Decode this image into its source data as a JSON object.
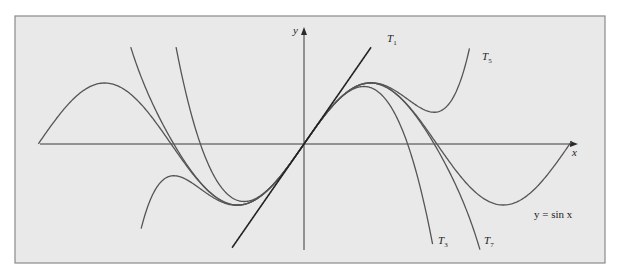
{
  "figure": {
    "title": "",
    "frame": {
      "x": 15,
      "y": 16,
      "width": 590,
      "height": 247,
      "background": "#e9e9e9",
      "border": "#8a8a8a"
    },
    "origin_px": {
      "x": 304,
      "y": 144
    },
    "scale_px": {
      "x": 42.3,
      "y": 61
    },
    "axes": {
      "x_label": "x",
      "y_label": "y",
      "x_axis_px": {
        "from": 40,
        "to": 578
      },
      "y_axis_px": {
        "from": 250,
        "to": 28
      }
    },
    "labels": {
      "T1": {
        "main": "T",
        "sub": "1"
      },
      "T3": {
        "main": "T",
        "sub": "3"
      },
      "T5": {
        "main": "T",
        "sub": "5"
      },
      "T7": {
        "main": "T",
        "sub": "7"
      },
      "sin": "y = sin x"
    },
    "colors": {
      "curve": "#555555",
      "tangent": "#222222",
      "axis": "#3a3a3a"
    }
  },
  "chart_data": {
    "type": "line",
    "title": "",
    "xlabel": "x",
    "ylabel": "y",
    "xlim": [
      -6.28,
      6.4
    ],
    "ylim": [
      -1.75,
      1.9
    ],
    "grid": false,
    "legend": "inline labels",
    "series": [
      {
        "name": "y = sin x",
        "formula": "sin(x)",
        "domain": [
          -6.28,
          6.33
        ]
      },
      {
        "name": "T1",
        "formula": "x",
        "domain": [
          -1.7,
          1.9
        ]
      },
      {
        "name": "T3",
        "formula": "x - x^3/6",
        "domain": [
          -3.04,
          3.04
        ]
      },
      {
        "name": "T5",
        "formula": "x - x^3/6 + x^5/120",
        "domain": [
          -3.85,
          4.03
        ]
      },
      {
        "name": "T7",
        "formula": "x - x^3/6 + x^5/120 - x^7/5040",
        "domain": [
          -4.18,
          4.18
        ]
      }
    ]
  }
}
